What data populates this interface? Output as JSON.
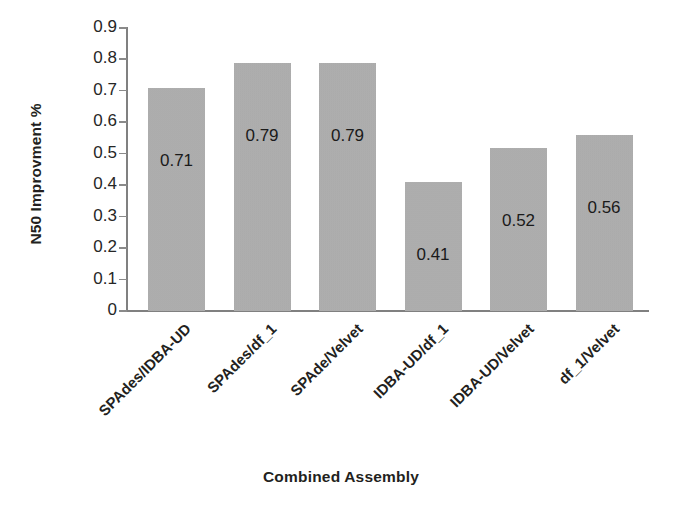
{
  "chart_data": {
    "type": "bar",
    "title": "",
    "xlabel": "Combined Assembly",
    "ylabel": "N50 Improvment %",
    "categories": [
      "SPAdes/IDBA-UD",
      "SPAdes/df_1",
      "SPAde/Velvet",
      "IDBA-UD/df_1",
      "IDBA-UD/Velvet",
      "df_1/Velvet"
    ],
    "values": [
      0.71,
      0.79,
      0.79,
      0.41,
      0.52,
      0.56
    ],
    "value_labels": [
      "0.71",
      "0.79",
      "0.79",
      "0.41",
      "0.52",
      "0.56"
    ],
    "ylim": [
      0,
      0.9
    ],
    "ytick_labels": [
      "0.9",
      "0.8",
      "0.7",
      "0.6",
      "0.5",
      "0.4",
      "0.3",
      "0.2",
      "0.1",
      "0"
    ],
    "ytick_values": [
      0.9,
      0.8,
      0.7,
      0.6,
      0.5,
      0.4,
      0.3,
      0.2,
      0.1,
      0
    ],
    "grid": false,
    "legend": false,
    "legend_position": "none",
    "bar_color": "#b0b0b0",
    "axis_color": "#808080",
    "text_color": "#231f20",
    "background_color": "#ffffff",
    "series": [
      {
        "name": "N50 Improvment %",
        "values": [
          0.71,
          0.79,
          0.79,
          0.41,
          0.52,
          0.56
        ]
      }
    ]
  }
}
